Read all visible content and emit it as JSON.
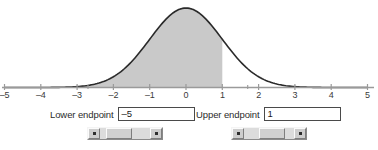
{
  "chart_data": {
    "type": "area",
    "title": "",
    "xlabel": "",
    "ylabel": "",
    "xlim": [
      -5,
      5
    ],
    "ylim": [
      0,
      1
    ],
    "grid": false,
    "legend": null,
    "curve": "standard-normal-density",
    "tick_labels": [
      "–5",
      "–4",
      "–3",
      "–2",
      "–1",
      "0",
      "1",
      "2",
      "3",
      "4",
      "5"
    ],
    "tick_values": [
      -5,
      -4,
      -3,
      -2,
      -1,
      0,
      1,
      2,
      3,
      4,
      5
    ],
    "minor_tick_values": [
      -2.7,
      1.7
    ],
    "shaded_region": {
      "from": -5,
      "to": 1,
      "fill_color": "#c9c9c9",
      "edge_color": "#2a2a2a"
    },
    "curve_color": "#2a2a2a",
    "axis_color": "#9a9a9a",
    "series": [
      {
        "name": "normal pdf",
        "x": [
          -5,
          -4.5,
          -4,
          -3.5,
          -3,
          -2.5,
          -2,
          -1.5,
          -1,
          -0.5,
          0,
          0.5,
          1,
          1.5,
          2,
          2.5,
          3,
          3.5,
          4,
          4.5,
          5
        ],
        "values": [
          1.5e-06,
          1.6e-05,
          0.000134,
          0.000873,
          0.004432,
          0.017528,
          0.053991,
          0.129518,
          0.241971,
          0.352065,
          0.398942,
          0.352065,
          0.241971,
          0.129518,
          0.053991,
          0.017528,
          0.004432,
          0.000873,
          0.000134,
          1.6e-05,
          1.5e-06
        ]
      }
    ]
  },
  "controls": {
    "lower": {
      "label": "Lower endpoint",
      "value": "–5",
      "placeholder": "",
      "scroll_left_icon": "left-arrow-icon",
      "scroll_right_icon": "right-arrow-icon",
      "thumb_position_pct": 22
    },
    "upper": {
      "label": "Upper endpoint",
      "value": "1",
      "placeholder": "",
      "scroll_left_icon": "left-arrow-icon",
      "scroll_right_icon": "right-arrow-icon",
      "thumb_position_pct": 62
    }
  },
  "colors": {
    "shade": "#c9c9c9",
    "curve": "#2a2a2a",
    "axis": "#9a9a9a",
    "text": "#2b2b2b",
    "control_face": "#d0d0d0"
  }
}
